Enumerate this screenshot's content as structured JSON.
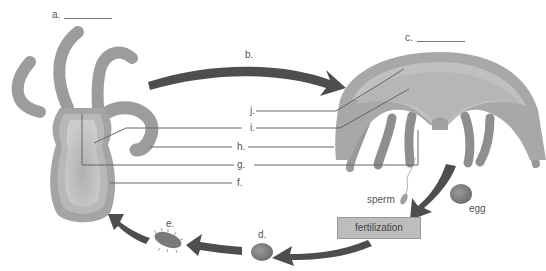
{
  "diagram": {
    "labels": {
      "a": {
        "letter": "a.",
        "blank": true
      },
      "b": {
        "letter": "b."
      },
      "c": {
        "letter": "c.",
        "blank": true
      },
      "d": {
        "letter": "d."
      },
      "e": {
        "letter": "e."
      },
      "f": {
        "letter": "f."
      },
      "g": {
        "letter": "g."
      },
      "h": {
        "letter": "h."
      },
      "i": {
        "letter": "i."
      },
      "j": {
        "letter": "j."
      }
    },
    "text": {
      "sperm": "sperm",
      "egg": "egg",
      "fertilization": "fertilization"
    },
    "colors": {
      "background": "#ffffff",
      "body_outer": "#9a9a9a",
      "body_mid": "#b4b4b4",
      "body_inner": "#c8c8c8",
      "arrow": "#505050",
      "leader_line": "#666666",
      "box_fill": "#bdbdbd"
    }
  }
}
